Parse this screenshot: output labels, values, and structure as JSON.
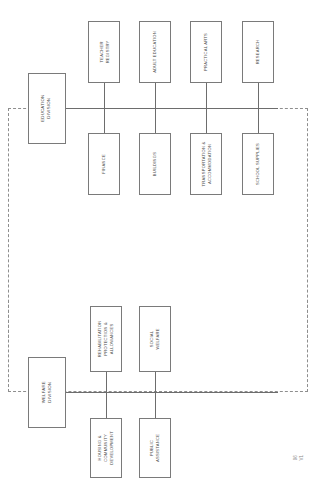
{
  "document": {
    "type": "organizational-chart",
    "orientation": "rotated-90-ccw",
    "corner_mark": "96\nV1"
  },
  "divisions": [
    {
      "id": "education",
      "root_label": "EDUCATION\nDIVISION",
      "upper_branches": [
        {
          "label": "TEACHER\nREGISTRY"
        },
        {
          "label": "ADULT EDUCATION"
        },
        {
          "label": "PRACTICAL ARTS"
        },
        {
          "label": "RESEARCH"
        }
      ],
      "lower_branches": [
        {
          "label": "FINANCE"
        },
        {
          "label": "BUILDINGS"
        },
        {
          "label": "TRANSPORTATION &\nACCOMMODATION"
        },
        {
          "label": "SCHOOL SUPPLIES"
        }
      ]
    },
    {
      "id": "welfare",
      "root_label": "WELFARE\nDIVISION",
      "upper_branches": [
        {
          "label": "REHABILITATION\nPROTECTION &\nALLOWANCES"
        },
        {
          "label": "SOCIAL\nWELFARE"
        }
      ],
      "lower_branches": [
        {
          "label": "HOUSING &\nCOMMUNITY\nDEVELOPMENT"
        },
        {
          "label": "PUBLIC\nASSISTANCE"
        }
      ]
    }
  ],
  "colors": {
    "box_border": "#7a7a7a",
    "connector": "#6d6d6d",
    "region_border": "#8e8e8e",
    "text": "#4a4a4a",
    "background": "#ffffff"
  }
}
